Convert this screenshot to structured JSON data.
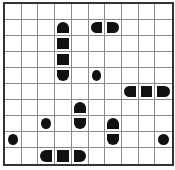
{
  "puzzle": {
    "type": "battleship",
    "rows": 10,
    "cols": 10,
    "colors": {
      "ship": "#111111",
      "grid": "#8a8a8a",
      "border": "#333333",
      "background": "#ffffff"
    },
    "segments": [
      {
        "row": 1,
        "col": 3,
        "shape": "top"
      },
      {
        "row": 2,
        "col": 3,
        "shape": "middle"
      },
      {
        "row": 3,
        "col": 3,
        "shape": "middle"
      },
      {
        "row": 4,
        "col": 3,
        "shape": "bottom"
      },
      {
        "row": 1,
        "col": 5,
        "shape": "left"
      },
      {
        "row": 1,
        "col": 6,
        "shape": "right"
      },
      {
        "row": 4,
        "col": 5,
        "shape": "circle"
      },
      {
        "row": 5,
        "col": 7,
        "shape": "left"
      },
      {
        "row": 5,
        "col": 8,
        "shape": "middle"
      },
      {
        "row": 5,
        "col": 9,
        "shape": "right"
      },
      {
        "row": 6,
        "col": 4,
        "shape": "top"
      },
      {
        "row": 7,
        "col": 4,
        "shape": "bottom"
      },
      {
        "row": 7,
        "col": 2,
        "shape": "circle"
      },
      {
        "row": 7,
        "col": 6,
        "shape": "top"
      },
      {
        "row": 8,
        "col": 6,
        "shape": "bottom"
      },
      {
        "row": 8,
        "col": 0,
        "shape": "circle"
      },
      {
        "row": 8,
        "col": 9,
        "shape": "circle"
      },
      {
        "row": 9,
        "col": 2,
        "shape": "left"
      },
      {
        "row": 9,
        "col": 3,
        "shape": "middle"
      },
      {
        "row": 9,
        "col": 4,
        "shape": "right"
      }
    ]
  }
}
